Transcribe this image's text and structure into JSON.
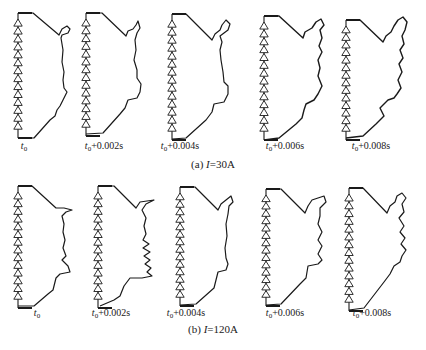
{
  "figure": {
    "line_color": "#1a1a1a",
    "rows": [
      {
        "caption_prefix": "(a) ",
        "caption_var": "I",
        "caption_value": "=30A",
        "caption_x": 213,
        "caption_y": 164,
        "label_y": 146,
        "panels": [
          {
            "label_base": "t",
            "label_sub": "0",
            "label_suffix": "",
            "label_x": 24,
            "stack_x": 18,
            "top_y": 13,
            "bot_y": 138,
            "arc": "M18,13 L33,13 L59,35 L62,29 L67,26 L70,29 L68,33 L62,35 L61,38 L63,50 L62,62 L64,72 L63,80 L64,88 L67,92 L63,100 L60,106 L57,110 L55,116 L50,120 L34,138 L18,138"
          },
          {
            "label_base": "t",
            "label_sub": "0",
            "label_suffix": "+0.002s",
            "label_x": 104,
            "stack_x": 86,
            "top_y": 13,
            "bot_y": 136,
            "arc": "M86,13 L102,13 L126,36 L128,31 L133,29 L136,25 L138,21 L140,28 L137,33 L135,40 L136,50 L134,60 L137,70 L137,78 L141,84 L140,92 L137,98 L128,100 L125,108 L120,114 L103,133 L86,134"
          },
          {
            "label_base": "t",
            "label_sub": "0",
            "label_suffix": "+0.004s",
            "label_x": 180,
            "stack_x": 172,
            "top_y": 14,
            "bot_y": 140,
            "arc": "M172,14 L186,14 L212,40 L215,34 L220,30 L222,25 L226,20 L230,24 L228,30 L224,33 L220,36 L222,42 L220,50 L221,60 L223,72 L224,82 L228,86 L228,94 L224,102 L214,104 L212,112 L206,120 L186,138 L172,139"
          },
          {
            "label_base": "t",
            "label_sub": "0",
            "label_suffix": "+0.006s",
            "label_x": 285,
            "stack_x": 264,
            "top_y": 16,
            "bot_y": 140,
            "arc": "M264,16 L279,16 L303,38 L305,32 L312,28 L316,22 L321,19 L324,25 L320,30 L322,38 L319,46 L322,52 L318,60 L320,68 L318,76 L322,86 L318,94 L314,100 L306,104 L304,110 L302,118 L296,124 L279,138 L264,140"
          },
          {
            "label_base": "t",
            "label_sub": "0",
            "label_suffix": "+0.008s",
            "label_x": 371,
            "stack_x": 346,
            "top_y": 20,
            "bot_y": 140,
            "arc": "M346,20 L360,20 L383,42 L386,36 L391,32 L394,26 L398,20 L403,17 L407,22 L405,30 L402,36 L404,44 L400,50 L403,58 L399,64 L402,72 L398,80 L401,88 L397,94 L394,98 L388,100 L384,104 L380,108 L384,116 L376,124 L363,136 L346,138"
          }
        ]
      },
      {
        "caption_prefix": "(b) ",
        "caption_var": "I",
        "caption_value": "=120A",
        "caption_x": 213,
        "caption_y": 329,
        "label_y": 313,
        "panels": [
          {
            "label_base": "t",
            "label_sub": "0",
            "label_suffix": "",
            "label_x": 37,
            "stack_x": 18,
            "top_y": 186,
            "bot_y": 308,
            "arc": "M18,186 L32,186 L56,208 L64,208 L72,210 L66,212 L62,216 L64,224 L63,232 L65,240 L63,248 L66,256 L62,260 L68,266 L70,272 L60,274 L56,278 L53,290 L48,294 L34,306 L18,306"
          },
          {
            "label_base": "t",
            "label_sub": "0",
            "label_suffix": "+0.002s",
            "label_x": 111,
            "stack_x": 98,
            "top_y": 186,
            "bot_y": 308,
            "arc": "M98,186 L114,186 L136,208 L140,202 L154,200 L146,204 L142,210 L146,218 L144,226 L146,234 L143,240 L149,244 L143,248 L150,252 L144,256 L150,260 L145,264 L151,268 L147,272 L152,276 L142,278 L130,278 L124,286 L120,296 L114,300 L100,306"
          },
          {
            "label_base": "t",
            "label_sub": "0",
            "label_suffix": "+0.004s",
            "label_x": 186,
            "stack_x": 180,
            "top_y": 187,
            "bot_y": 306,
            "arc": "M180,187 L195,187 L218,210 L221,204 L226,200 L231,196 L233,202 L229,206 L228,214 L226,224 L227,236 L225,248 L226,258 L228,264 L226,270 L218,272 L216,280 L214,288 L196,304 L180,305"
          },
          {
            "label_base": "t",
            "label_sub": "0",
            "label_suffix": "+0.006s",
            "label_x": 285,
            "stack_x": 266,
            "top_y": 189,
            "bot_y": 306,
            "arc": "M266,189 L281,189 L305,213 L308,206 L312,200 L318,198 L324,196 L326,202 L320,208 L320,216 L318,224 L322,232 L318,240 L322,246 L318,254 L322,260 L318,264 L308,266 L306,278 L300,284 L281,304 L266,305"
          },
          {
            "label_base": "t",
            "label_sub": "0",
            "label_suffix": "+0.008s",
            "label_x": 372,
            "stack_x": 349,
            "top_y": 188,
            "bot_y": 311,
            "arc": "M349,188 L363,188 L387,213 L390,206 L395,202 L397,196 L402,193 L406,198 L402,204 L404,212 L399,218 L404,226 L400,232 L405,238 L401,244 L406,250 L402,256 L400,262 L394,266 L390,274 L384,282 L364,308 L349,310"
          }
        ]
      }
    ]
  }
}
